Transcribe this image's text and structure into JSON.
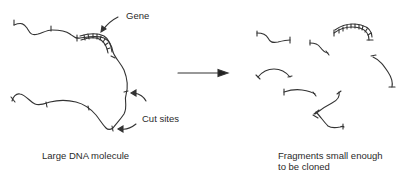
{
  "diagram": {
    "left_panel": {
      "caption": "Large DNA molecule",
      "gene_label": "Gene",
      "cut_sites_label": "Cut sites"
    },
    "arrow": {
      "direction": "right"
    },
    "right_panel": {
      "caption_line1": "Fragments small enough",
      "caption_line2": "to be cloned",
      "fragment_count": 9,
      "gene_fragment_count": 1
    },
    "colors": {
      "stroke": "#333333",
      "text": "#2a2a2a",
      "background": "#ffffff"
    }
  }
}
